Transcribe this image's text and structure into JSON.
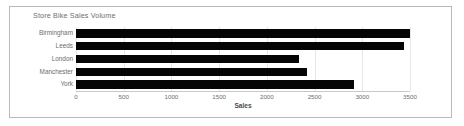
{
  "chart_data": {
    "type": "bar",
    "orientation": "horizontal",
    "title": "Store Bike Sales Volume",
    "xlabel": "Sales",
    "ylabel": "",
    "categories": [
      "Birmingham",
      "Leeds",
      "London",
      "Manchester",
      "York"
    ],
    "values": [
      3500,
      3440,
      2340,
      2420,
      2910
    ],
    "series": [
      {
        "name": "Sales",
        "values": [
          3500,
          3440,
          2340,
          2420,
          2910
        ]
      }
    ],
    "xlim": [
      0,
      3500
    ],
    "xticks": [
      "0",
      "500",
      "1000",
      "1500",
      "2000",
      "2500",
      "3000",
      "3500"
    ],
    "xtick_values": [
      0,
      500,
      1000,
      1500,
      2000,
      2500,
      3000,
      3500
    ],
    "grid": true,
    "grid_axis": "x",
    "legend": false,
    "bar_color": "#050505",
    "grid_color": "#e6e6e6",
    "text_color": "#6e6e6e",
    "border_color": "#b9b9b9",
    "background": "#ffffff"
  }
}
